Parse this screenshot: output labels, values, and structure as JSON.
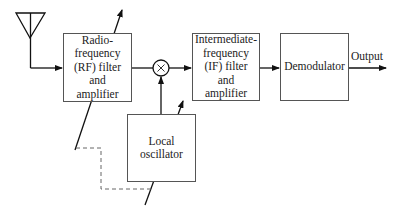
{
  "diagram": {
    "blocks": {
      "rf": {
        "label": "Radio-frequency (RF) filter and amplifier",
        "lines": [
          "Radio-",
          "frequency",
          "(RF) filter",
          "and",
          "amplifier"
        ]
      },
      "if": {
        "label": "Intermediate-frequency (IF) filter and amplifier",
        "lines": [
          "Intermediate-",
          "frequency",
          "(IF) filter",
          "and",
          "amplifier"
        ]
      },
      "demod": {
        "label": "Demodulator"
      },
      "lo": {
        "label": "Local oscillator",
        "lines": [
          "Local",
          "oscillator"
        ]
      }
    },
    "mixer_symbol": "×",
    "output_label": "Output",
    "icons": [
      "antenna-icon",
      "mixer-icon"
    ],
    "colors": {
      "line": "#111111",
      "box_border": "#555555",
      "dashed": "#666666"
    }
  }
}
